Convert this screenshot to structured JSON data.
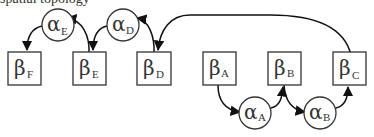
{
  "caption": "spatial topology",
  "nodes": {
    "beta_F": {
      "symbol": "β",
      "sub": "F"
    },
    "beta_E": {
      "symbol": "β",
      "sub": "E"
    },
    "beta_D": {
      "symbol": "β",
      "sub": "D"
    },
    "beta_A": {
      "symbol": "β",
      "sub": "A"
    },
    "beta_B": {
      "symbol": "β",
      "sub": "B"
    },
    "beta_C": {
      "symbol": "β",
      "sub": "C"
    },
    "alpha_E": {
      "symbol": "α",
      "sub": "E"
    },
    "alpha_D": {
      "symbol": "α",
      "sub": "D"
    },
    "alpha_A": {
      "symbol": "α",
      "sub": "A"
    },
    "alpha_B": {
      "symbol": "α",
      "sub": "B"
    }
  },
  "edges": [
    {
      "from": "beta_A",
      "to": "alpha_A"
    },
    {
      "from": "alpha_A",
      "to": "beta_B"
    },
    {
      "from": "beta_B",
      "to": "alpha_B"
    },
    {
      "from": "alpha_B",
      "to": "beta_C"
    },
    {
      "from": "beta_C",
      "to": "beta_D"
    },
    {
      "from": "beta_D",
      "to": "alpha_D"
    },
    {
      "from": "alpha_D",
      "to": "beta_E"
    },
    {
      "from": "beta_E",
      "to": "alpha_E"
    },
    {
      "from": "alpha_E",
      "to": "beta_F"
    }
  ]
}
